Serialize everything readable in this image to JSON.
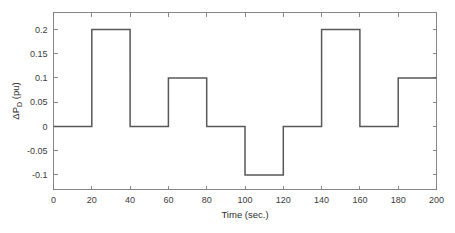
{
  "chart_data": {
    "type": "line",
    "title": "",
    "xlabel": "Time (sec.)",
    "ylabel": "ΔP",
    "ylabel_sub": "D",
    "ylabel_unit": " (pu)",
    "ylabel_full": "ΔP_D (pu)",
    "xlim": [
      0,
      200
    ],
    "ylim": [
      -0.13,
      0.235
    ],
    "grid": false,
    "legend": null,
    "line_color": "#585858",
    "axis_color": "#7a7a7a",
    "xticks": [
      0,
      20,
      40,
      60,
      80,
      100,
      120,
      140,
      160,
      180,
      200
    ],
    "xtick_labels": [
      "0",
      "20",
      "40",
      "60",
      "80",
      "100",
      "120",
      "140",
      "160",
      "180",
      "200"
    ],
    "yticks": [
      -0.1,
      -0.05,
      0,
      0.05,
      0.1,
      0.15,
      0.2
    ],
    "ytick_labels": [
      "-0.1",
      "-0.05",
      "0",
      "0.05",
      "0.1",
      "0.15",
      "0.2"
    ],
    "step_segments": [
      {
        "t_start": 0,
        "t_end": 20,
        "value": 0
      },
      {
        "t_start": 20,
        "t_end": 40,
        "value": 0.2
      },
      {
        "t_start": 40,
        "t_end": 60,
        "value": 0
      },
      {
        "t_start": 60,
        "t_end": 80,
        "value": 0.1
      },
      {
        "t_start": 80,
        "t_end": 100,
        "value": 0
      },
      {
        "t_start": 100,
        "t_end": 120,
        "value": -0.1
      },
      {
        "t_start": 120,
        "t_end": 140,
        "value": 0
      },
      {
        "t_start": 140,
        "t_end": 160,
        "value": 0.2
      },
      {
        "t_start": 160,
        "t_end": 180,
        "value": 0
      },
      {
        "t_start": 180,
        "t_end": 200,
        "value": 0.1
      }
    ],
    "x": [
      0,
      20,
      20,
      40,
      40,
      60,
      60,
      80,
      80,
      100,
      100,
      120,
      120,
      140,
      140,
      160,
      160,
      180,
      180,
      200
    ],
    "values": [
      0,
      0,
      0.2,
      0.2,
      0,
      0,
      0.1,
      0.1,
      0,
      0,
      -0.1,
      -0.1,
      0,
      0,
      0.2,
      0.2,
      0,
      0,
      0.1,
      0.1
    ]
  }
}
